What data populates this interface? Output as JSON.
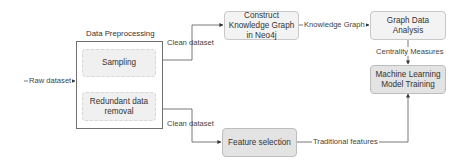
{
  "diagram": {
    "groups": {
      "preprocessing": {
        "title": "Data Preprocessing"
      }
    },
    "nodes": {
      "sampling": "Sampling",
      "redundant": "Redundant data removal",
      "construct_kg": "Construct Knowledge Graph in Neo4j",
      "graph_analysis": "Graph Data Analysis",
      "ml_training": "Machine Learning Model Training",
      "feature_selection": "Feature selection"
    },
    "edges": {
      "raw_dataset": "Raw dataset",
      "clean_dataset_top": "Clean dataset",
      "clean_dataset_bottom": "Clean dataset",
      "knowledge_graph": "Knowledge Graph",
      "centrality_measures": "Centrality Measures",
      "traditional_features": "Traditional features"
    },
    "colors": {
      "light_node": "#f3f3f3",
      "dark_node": "#e3e3e3",
      "line": "#555555"
    }
  }
}
